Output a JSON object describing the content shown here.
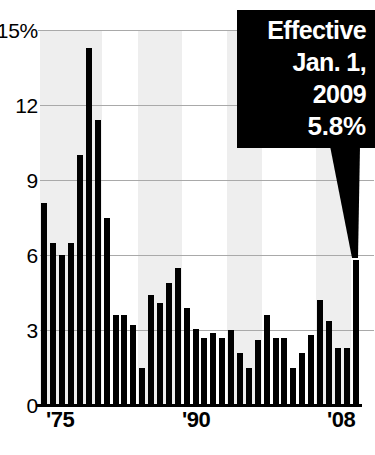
{
  "chart_data": {
    "type": "bar",
    "title": "",
    "subtitle": "",
    "xlabel": "",
    "ylabel": "",
    "ylim": [
      0,
      15
    ],
    "yticks": [
      0,
      3,
      6,
      9,
      12,
      15
    ],
    "ytick_labels": [
      "0",
      "3",
      "6",
      "9",
      "12",
      "15%"
    ],
    "grid": true,
    "legend": null,
    "bar_color": "#000000",
    "band_color": "#eeeeee",
    "x": [
      "1974",
      "1975",
      "1976",
      "1977",
      "1978",
      "1979",
      "1980",
      "1981",
      "1982",
      "1983",
      "1984",
      "1985",
      "1986",
      "1987",
      "1988",
      "1989",
      "1990",
      "1991",
      "1992",
      "1993",
      "1994",
      "1995",
      "1996",
      "1997",
      "1998",
      "1999",
      "2000",
      "2001",
      "2002",
      "2003",
      "2004",
      "2005",
      "2006",
      "2007",
      "2008",
      "2009"
    ],
    "values": [
      8.1,
      6.5,
      6.0,
      6.5,
      10.0,
      14.3,
      11.4,
      7.5,
      3.6,
      3.6,
      3.2,
      1.5,
      4.4,
      4.1,
      4.9,
      5.5,
      3.9,
      3.05,
      2.7,
      2.9,
      2.7,
      3.0,
      2.1,
      1.5,
      2.6,
      3.6,
      2.7,
      2.7,
      1.5,
      2.1,
      2.8,
      4.2,
      3.35,
      2.3,
      2.3,
      5.8
    ],
    "xtick_labels": [
      "'75",
      "'90",
      "'08"
    ],
    "xtick_positions": [
      1975,
      1990,
      2008
    ],
    "shaded_bands": [
      {
        "from": "1974",
        "to": "1981"
      },
      {
        "from": "1985",
        "to": "1990"
      },
      {
        "from": "1995",
        "to": "1999"
      },
      {
        "from": "2005",
        "to": "2009"
      }
    ],
    "annotation": {
      "lines": [
        "Effective",
        "Jan. 1,",
        "2009"
      ],
      "value": "5.8%",
      "points_to": {
        "x": "2009",
        "y": 5.8
      },
      "background": "#000000",
      "text_color": "#ffffff"
    }
  },
  "yaxis": {
    "ticks": [
      {
        "label": "15%",
        "value": 15
      },
      {
        "label": "12",
        "value": 12
      },
      {
        "label": "9",
        "value": 9
      },
      {
        "label": "6",
        "value": 6
      },
      {
        "label": "3",
        "value": 3
      },
      {
        "label": "0",
        "value": 0
      }
    ]
  },
  "xaxis": {
    "ticks": [
      {
        "label": "'75",
        "left": 46
      },
      {
        "label": "'90",
        "left": 182
      },
      {
        "label": "'08",
        "left": 327
      }
    ]
  },
  "callout": {
    "line1": "Effective",
    "line2": "Jan. 1,",
    "line3": "2009",
    "value": "5.8%"
  }
}
